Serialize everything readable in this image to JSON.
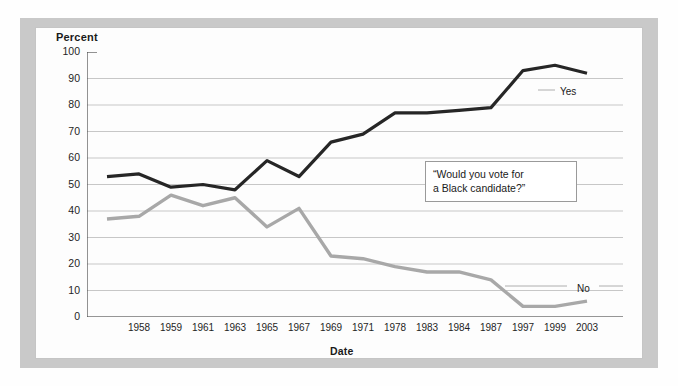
{
  "chart_data": {
    "type": "line",
    "title": "",
    "xlabel": "Date",
    "ylabel": "Percent",
    "ylim": [
      0,
      100
    ],
    "ytick_labels": [
      "100",
      "90",
      "80",
      "70",
      "60",
      "50",
      "40",
      "30",
      "20",
      "10",
      "0"
    ],
    "ytick_values": [
      100,
      90,
      80,
      70,
      60,
      50,
      40,
      30,
      20,
      10,
      0
    ],
    "grid": true,
    "grid_axis": "y",
    "legend_position": "inline-right",
    "categories": [
      "",
      "1958",
      "1959",
      "1961",
      "1963",
      "1965",
      "1967",
      "1969",
      "1971",
      "1978",
      "1983",
      "1984",
      "1987",
      "1997",
      "1999",
      "2003"
    ],
    "tick_labels": [
      "1958",
      "1959",
      "1961",
      "1963",
      "1965",
      "1967",
      "1969",
      "1971",
      "1978",
      "1983",
      "1984",
      "1987",
      "1997",
      "1999",
      "2003"
    ],
    "series": [
      {
        "name": "Yes",
        "color": "#262626",
        "values": [
          53,
          54,
          49,
          50,
          48,
          59,
          53,
          66,
          69,
          77,
          77,
          78,
          79,
          93,
          95,
          92
        ]
      },
      {
        "name": "No",
        "color": "#a8a8a8",
        "values": [
          37,
          38,
          46,
          42,
          45,
          34,
          41,
          23,
          22,
          19,
          17,
          17,
          14,
          4,
          4,
          6
        ]
      }
    ],
    "annotations": [
      {
        "name": "survey-question",
        "line1": "“Would you vote for",
        "line2": "a Black candidate?”"
      }
    ]
  },
  "labels": {
    "percent": "Percent",
    "date": "Date"
  },
  "colors": {
    "panel": "#c9c9c9",
    "card": "#fdfdfd",
    "yes": "#262626",
    "no": "#a8a8a8",
    "grid": "#b9b9b9",
    "axis": "#4a4a4a"
  }
}
